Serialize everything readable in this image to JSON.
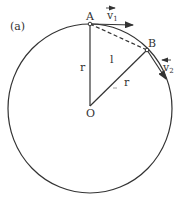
{
  "figure": {
    "panel_label": "(a)",
    "stroke_color": "#333333",
    "background": "#ffffff"
  },
  "points": {
    "A": {
      "label": "A"
    },
    "B": {
      "label": "B"
    },
    "O": {
      "label": "O"
    }
  },
  "vectors": {
    "v1": {
      "symbol": "v",
      "subscript": "1"
    },
    "v2": {
      "symbol": "v",
      "subscript": "2"
    }
  },
  "segments": {
    "OA": {
      "label": "r"
    },
    "OB": {
      "label": "r"
    },
    "arc_label": {
      "label": "l"
    }
  }
}
